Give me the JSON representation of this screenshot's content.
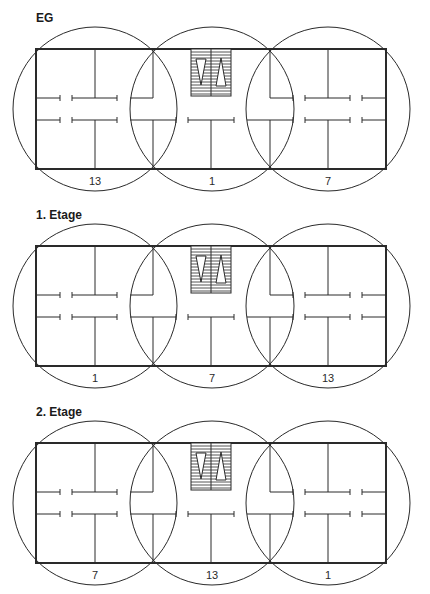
{
  "diagram": {
    "type": "building-floor-plans",
    "colors": {
      "line": "#2a2a2a",
      "background": "#ffffff"
    },
    "floors": [
      {
        "title": "EG",
        "wing_labels": [
          "13",
          "1",
          "7"
        ]
      },
      {
        "title": "1. Etage",
        "wing_labels": [
          "1",
          "7",
          "13"
        ]
      },
      {
        "title": "2. Etage",
        "wing_labels": [
          "7",
          "13",
          "1"
        ]
      }
    ],
    "elements": {
      "outer_wall": "rectangle",
      "wing_circles": 3,
      "stairwell": "hatched-stair-core",
      "corridor": "central-double-line-corridor"
    }
  }
}
